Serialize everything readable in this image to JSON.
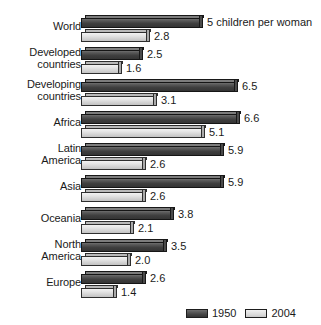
{
  "chart_data": {
    "type": "bar",
    "orientation": "horizontal",
    "title": "",
    "xlabel": "",
    "ylabel": "",
    "unit_note": "children per woman",
    "unit_note_attached_to": {
      "category": "World",
      "series": "1950",
      "value": 5
    },
    "categories": [
      "World",
      "Developed\ncountries",
      "Developing\ncountries",
      "Africa",
      "Latin\nAmerica",
      "Asia",
      "Oceania",
      "North\nAmerica",
      "Europe"
    ],
    "series": [
      {
        "name": "1950",
        "color": "#444444",
        "values": [
          5,
          2.5,
          6.5,
          6.6,
          5.9,
          5.9,
          3.8,
          3.5,
          2.6
        ],
        "labels": [
          "5",
          "2.5",
          "6.5",
          "6.6",
          "5.9",
          "5.9",
          "3.8",
          "3.5",
          "2.6"
        ]
      },
      {
        "name": "2004",
        "color": "#d9d9d9",
        "values": [
          2.8,
          1.6,
          3.1,
          5.1,
          2.6,
          2.6,
          2.1,
          2.0,
          1.4
        ],
        "labels": [
          "2.8",
          "1.6",
          "3.1",
          "5.1",
          "2.6",
          "2.6",
          "2.1",
          "2.0",
          "1.4"
        ]
      }
    ],
    "xlim": [
      0,
      7
    ],
    "grid": false,
    "legend_position": "bottom-right",
    "legend": [
      {
        "label": "1950",
        "color": "#444444"
      },
      {
        "label": "2004",
        "color": "#d9d9d9"
      }
    ]
  },
  "legend": {
    "items": [
      {
        "label": "1950"
      },
      {
        "label": "2004"
      }
    ]
  }
}
